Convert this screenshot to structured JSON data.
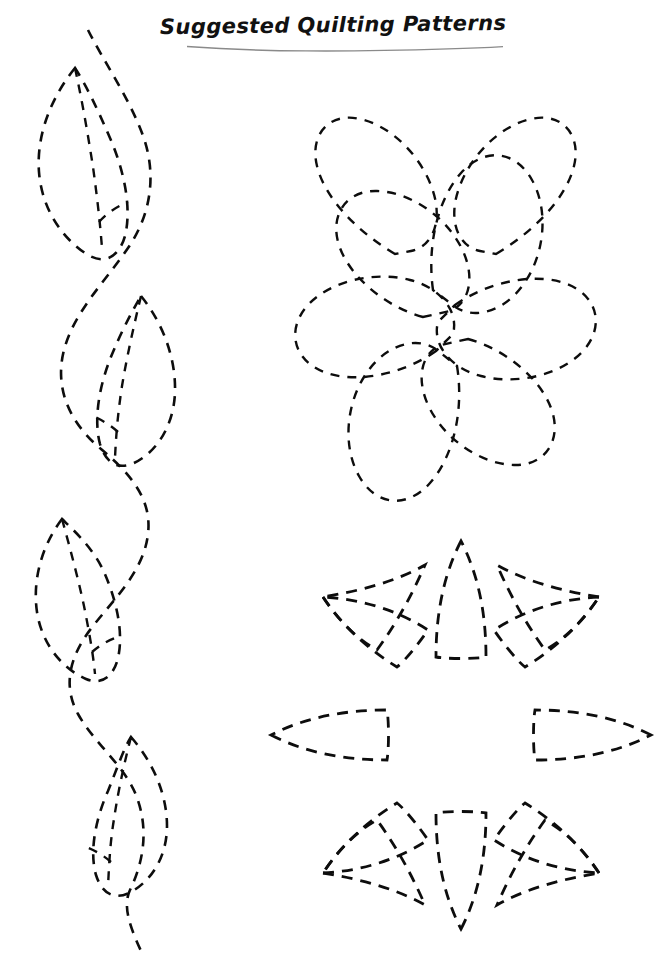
{
  "page": {
    "title": "Suggested Quilting Patterns",
    "width": 666,
    "height": 968,
    "background_color": "#ffffff",
    "ink_color": "#0d0d0d",
    "underline_color": "#8a8a8a"
  },
  "title": {
    "text": "Suggested Quilting Patterns",
    "style": "bold-italic-handwriting",
    "underline": "wavy-hand-drawn"
  },
  "patterns": [
    {
      "id": "leaf-vine",
      "name": "Leafy Vine Border",
      "position": "left-column",
      "repeats": 4,
      "stroke": "dashed",
      "dash": "10 8",
      "description": "Undulating vine with four alternating leaves, each leaf having an outer outline and a center vein"
    },
    {
      "id": "loop-wreath",
      "name": "Looped Circle Wreath",
      "position": "upper-right",
      "loops": 8,
      "stroke": "dashed",
      "dash": "9 8",
      "description": "Eight overlapping teardrop loops arranged in a ring, adjacent loops crossing in X shapes"
    },
    {
      "id": "eight-petal-flower",
      "name": "Eight Petal Flower",
      "position": "lower-right",
      "petals": 8,
      "stroke": "dashed",
      "dash": "11 8",
      "description": "Eight-pointed star flower, each petal bounded by two arcs meeting at a point"
    }
  ]
}
